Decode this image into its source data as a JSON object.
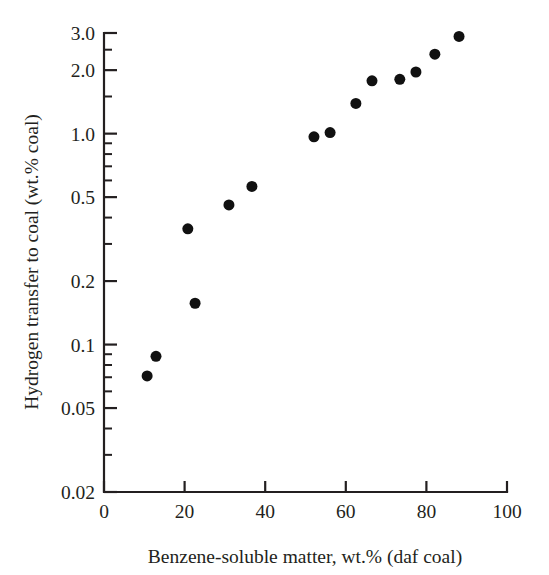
{
  "chart_data": {
    "type": "scatter",
    "title": "",
    "xlabel": "Benzene-soluble matter, wt.% (daf coal)",
    "ylabel": "Hydrogen transfer to coal (wt.% coal)",
    "xscale": "linear",
    "yscale": "log",
    "xlim": [
      0,
      100
    ],
    "ylim": [
      0.02,
      3.0
    ],
    "grid": false,
    "legend": null,
    "x_ticks": [
      0,
      20,
      40,
      60,
      80,
      100
    ],
    "x_tick_labels": [
      "0",
      "20",
      "40",
      "60",
      "80",
      "100"
    ],
    "y_ticks": [
      0.02,
      0.05,
      0.1,
      0.2,
      0.5,
      1.0,
      2.0,
      3.0
    ],
    "y_tick_labels": [
      "0.02",
      "0.05",
      "0.1",
      "0.2",
      "0.5",
      "1.0",
      "2.0",
      "3.0"
    ],
    "y_minor_ticks": [
      0.03,
      0.04,
      0.06,
      0.07,
      0.08,
      0.09,
      0.3,
      0.4,
      0.6,
      0.7,
      0.8,
      0.9,
      1.5,
      2.5
    ],
    "marker": "filled-circle",
    "marker_color": "#111111",
    "marker_size_px": 11,
    "series": [
      {
        "name": "Hydrogen transfer vs benzene-soluble matter",
        "points": [
          {
            "x": 10.7,
            "y": 0.071
          },
          {
            "x": 12.9,
            "y": 0.088
          },
          {
            "x": 20.8,
            "y": 0.354
          },
          {
            "x": 22.6,
            "y": 0.157
          },
          {
            "x": 31.0,
            "y": 0.459
          },
          {
            "x": 36.7,
            "y": 0.562
          },
          {
            "x": 52.1,
            "y": 0.966
          },
          {
            "x": 56.1,
            "y": 1.012
          },
          {
            "x": 62.5,
            "y": 1.39
          },
          {
            "x": 66.5,
            "y": 1.78
          },
          {
            "x": 73.4,
            "y": 1.81
          },
          {
            "x": 77.4,
            "y": 1.96
          },
          {
            "x": 82.1,
            "y": 2.38
          },
          {
            "x": 88.1,
            "y": 2.89
          }
        ]
      }
    ]
  },
  "colors": {
    "axis": "#231f20",
    "marker": "#111111",
    "background": "#ffffff"
  }
}
